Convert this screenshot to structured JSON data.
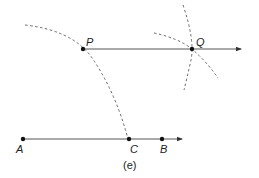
{
  "figure": {
    "caption": "(e)",
    "points": {
      "P": {
        "label": "P",
        "x": 83,
        "y": 49
      },
      "Q": {
        "label": "Q",
        "x": 192,
        "y": 49
      },
      "A": {
        "label": "A",
        "x": 23,
        "y": 139
      },
      "C": {
        "label": "C",
        "x": 129,
        "y": 139
      },
      "B": {
        "label": "B",
        "x": 162,
        "y": 139
      }
    },
    "rays": [
      {
        "name": "ray-PQ",
        "from": "P",
        "through": "Q",
        "end_x": 242
      },
      {
        "name": "ray-AB",
        "from": "A",
        "through": "B",
        "end_x": 183
      }
    ],
    "arcs": [
      {
        "name": "arc-centered-A",
        "style": "dashed"
      },
      {
        "name": "arc-near-Q-vertical",
        "style": "dashed"
      },
      {
        "name": "arc-near-Q-diagonal",
        "style": "dashed"
      }
    ],
    "colors": {
      "line": "#555555",
      "point": "#111111",
      "text": "#222222"
    }
  }
}
